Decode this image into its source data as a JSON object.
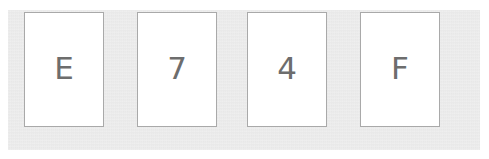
{
  "widget": {
    "name": "captcha-character-tiles",
    "background_color": "#ffffff",
    "panel_color": "#e4e4e4",
    "tile_background_color": "#ffffff",
    "tile_border_color": "#a9a9a9",
    "glyph_color": "#6d6d6d"
  },
  "tiles": [
    {
      "index": 1,
      "character": "E"
    },
    {
      "index": 2,
      "character": "7"
    },
    {
      "index": 3,
      "character": "4"
    },
    {
      "index": 4,
      "character": "F"
    }
  ],
  "code": {
    "value": "E74F",
    "length": 4
  }
}
